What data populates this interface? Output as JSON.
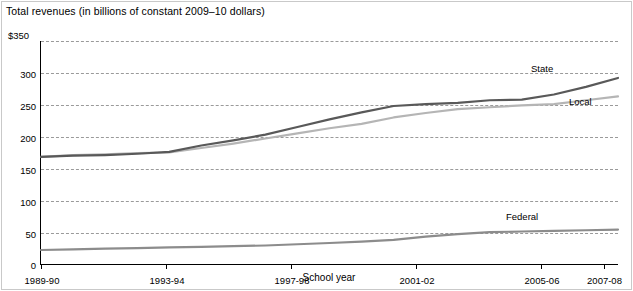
{
  "chart_data": {
    "type": "line",
    "title": "Total revenues (in billions of constant 2009–10 dollars)",
    "subtitle": "",
    "xlabel": "School year",
    "ylabel": "$350",
    "ylim": [
      0,
      350
    ],
    "yticks": [
      0,
      50,
      100,
      150,
      200,
      250,
      300,
      350
    ],
    "ytick_labels": [
      "0",
      "50",
      "100",
      "150",
      "200",
      "250",
      "300",
      "$350"
    ],
    "grid": true,
    "legend_position": "inline-right",
    "x": [
      "1989-90",
      "1990-91",
      "1991-92",
      "1992-93",
      "1993-94",
      "1994-95",
      "1995-96",
      "1996-97",
      "1997-98",
      "1998-99",
      "1999-2000",
      "2000-01",
      "2001-02",
      "2002-03",
      "2003-04",
      "2004-05",
      "2005-06",
      "2006-07",
      "2007-08"
    ],
    "xtick_labels": [
      "1989-90",
      "1993-94",
      "1997-98",
      "2001-02",
      "2005-06",
      "2007-08"
    ],
    "series": [
      {
        "name": "State",
        "color": "#595959",
        "values": [
          168,
          170,
          171,
          173,
          176,
          186,
          194,
          203,
          215,
          227,
          238,
          248,
          251,
          253,
          257,
          258,
          266,
          278,
          292
        ]
      },
      {
        "name": "Local",
        "color": "#b5b5b5",
        "values": [
          168,
          171,
          172,
          174,
          175,
          182,
          189,
          197,
          205,
          213,
          220,
          230,
          237,
          243,
          246,
          249,
          251,
          257,
          263
        ]
      },
      {
        "name": "Federal",
        "color": "#8c8c8c",
        "values": [
          22,
          23,
          24,
          25,
          26,
          27,
          28,
          29,
          31,
          33,
          35,
          38,
          43,
          47,
          50,
          51,
          52,
          53,
          54
        ]
      }
    ]
  },
  "labels": {
    "state": "State",
    "local": "Local",
    "federal": "Federal"
  }
}
